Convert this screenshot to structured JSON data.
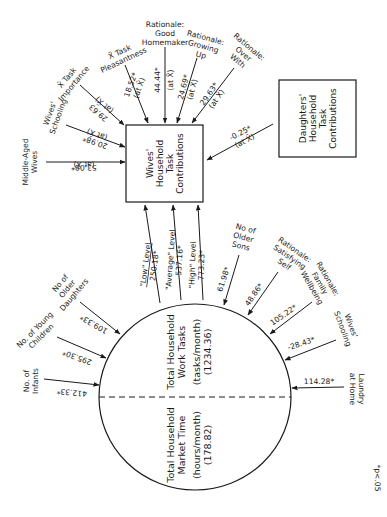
{
  "nodes": {
    "wives": {
      "lines": [
        "Wives'",
        "Household",
        "Task",
        "Contributions"
      ]
    },
    "daughters": {
      "lines": [
        "Daughters'",
        "Household",
        "Task",
        "Contributions"
      ]
    },
    "work_tasks": {
      "lines": [
        "Total Household",
        "Work Tasks",
        "(tasks/month)",
        "(1234.36)"
      ]
    },
    "market_time": {
      "lines": [
        "Total Household",
        "Market Time",
        "(hours/month)",
        "(178.82)"
      ]
    }
  },
  "inputs_to_wives": [
    {
      "label": [
        "Middle-Aged",
        "Wives"
      ],
      "value": "53.08*",
      "qualifier": "(at X̄)"
    },
    {
      "label": [
        "Wives'",
        "Schooling"
      ],
      "value": "20.98*",
      "qualifier": "(at X̄)"
    },
    {
      "label": [
        "X̄ Task",
        "Importance"
      ],
      "value": "29.63",
      "qualifier": "(at X̄)"
    },
    {
      "label": [
        "X̄ Task",
        "Pleasantness"
      ],
      "value": "18.52*",
      "qualifier": "(at X̄)"
    },
    {
      "label": [
        "Rationale:",
        "Good",
        "Homemaker"
      ],
      "value": "44.44*",
      "qualifier": "(at X̄)"
    },
    {
      "label": [
        "Rationale:",
        "Growing",
        "Up"
      ],
      "value": "24.69*",
      "qualifier": "(at X̄)"
    },
    {
      "label": [
        "Rationale:",
        "Over",
        "With"
      ],
      "value": "29.63*",
      "qualifier": "(at X̄)"
    },
    {
      "label": [
        "Daughters' Household Task Contributions"
      ],
      "value": "-0.25*",
      "qualifier": "(at X̄)"
    }
  ],
  "work_to_wives": [
    {
      "label": "\"Low\" Level",
      "value": "250.18*"
    },
    {
      "label": "\"Average\" Level",
      "value": "537.16*"
    },
    {
      "label": "\"High\" Level",
      "value": "773.23*"
    }
  ],
  "inputs_to_work": [
    {
      "label": [
        "No of",
        "Older",
        "Daughters"
      ],
      "value": "109.33*"
    },
    {
      "label": [
        "No. of Young",
        "Children"
      ],
      "value": "295.30*"
    },
    {
      "label": [
        "No. of",
        "Infants"
      ],
      "value": "412.33*"
    },
    {
      "label": [
        "No of",
        "Older",
        "Sons"
      ],
      "value": "61.98*"
    },
    {
      "label": [
        "Rationale:",
        "Satisfying",
        "Self"
      ],
      "value": "48.86*"
    },
    {
      "label": [
        "Rationale:",
        "Family",
        "Wellbeing"
      ],
      "value": "105.22*"
    },
    {
      "label": [
        "Wives'",
        "Schooling"
      ],
      "value": "-28.43*"
    },
    {
      "label": [
        "Laundry",
        "at Home"
      ],
      "value": "114.28*"
    }
  ],
  "footnote": "*p<.05"
}
